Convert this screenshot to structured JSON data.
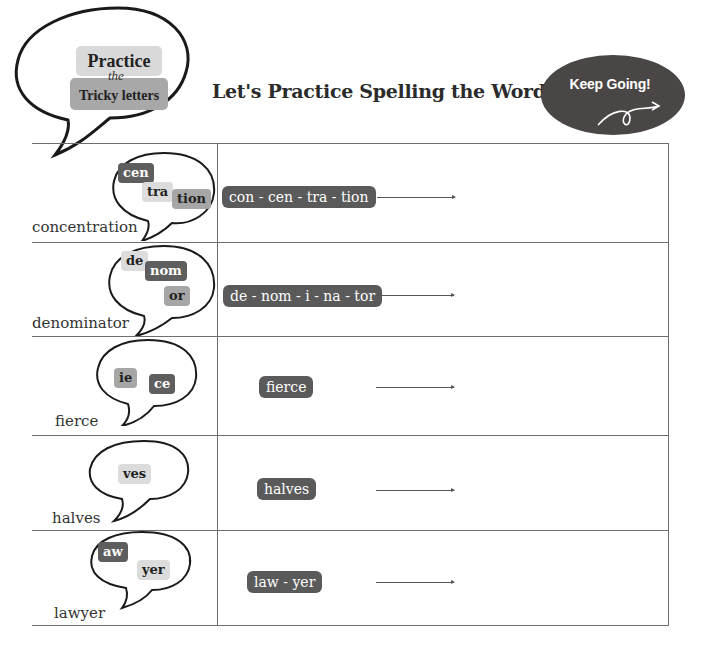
{
  "header": {
    "badge_line1": "Practice",
    "badge_connector": "the",
    "badge_line2": "Tricky letters",
    "title": "Let's  Practice Spelling the Word",
    "keep_going": "Keep Going!",
    "keep_going_icon": "curly-arrow-icon"
  },
  "colors": {
    "dark_chip": "#5e5e5e",
    "mid_chip": "#a6a6a6",
    "light_chip": "#dcdcdc",
    "keep_going_bg": "#4a4646",
    "table_line": "#6e6e6e"
  },
  "rows": [
    {
      "word": "concentration",
      "tricky": [
        {
          "text": "cen",
          "tone": "dark"
        },
        {
          "text": "tra",
          "tone": "light"
        },
        {
          "text": "tion",
          "tone": "mid"
        }
      ],
      "syllables": "con - cen - tra - tion"
    },
    {
      "word": "denominator",
      "tricky": [
        {
          "text": "de",
          "tone": "light"
        },
        {
          "text": "nom",
          "tone": "dark"
        },
        {
          "text": "or",
          "tone": "mid"
        }
      ],
      "syllables": "de - nom - i - na - tor"
    },
    {
      "word": "fierce",
      "tricky": [
        {
          "text": "ie",
          "tone": "mid"
        },
        {
          "text": "ce",
          "tone": "dark"
        }
      ],
      "syllables": "fierce"
    },
    {
      "word": "halves",
      "tricky": [
        {
          "text": "ves",
          "tone": "light"
        }
      ],
      "syllables": "halves"
    },
    {
      "word": "lawyer",
      "tricky": [
        {
          "text": "aw",
          "tone": "dark"
        },
        {
          "text": "yer",
          "tone": "light"
        }
      ],
      "syllables": "law - yer"
    }
  ]
}
